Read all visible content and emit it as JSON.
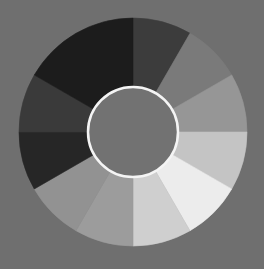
{
  "background": "#6f6f6f",
  "wheel": {
    "center": [
      133,
      132
    ],
    "outer_radius": 114,
    "inner_radius": 45,
    "inner_fill": "#727272",
    "inner_stroke": "#f4f4f4",
    "inner_stroke_width": 2.5,
    "segments": [
      {
        "name": "segment-0",
        "start": 0,
        "end": 30,
        "color": "#3c3c3c"
      },
      {
        "name": "segment-1",
        "start": 30,
        "end": 60,
        "color": "#7a7a7a"
      },
      {
        "name": "segment-2",
        "start": 60,
        "end": 90,
        "color": "#969696"
      },
      {
        "name": "segment-3",
        "start": 90,
        "end": 120,
        "color": "#c4c4c4"
      },
      {
        "name": "segment-4",
        "start": 120,
        "end": 150,
        "color": "#ececec"
      },
      {
        "name": "segment-5",
        "start": 150,
        "end": 180,
        "color": "#cfcfcf"
      },
      {
        "name": "segment-6",
        "start": 180,
        "end": 210,
        "color": "#9c9c9c"
      },
      {
        "name": "segment-7",
        "start": 210,
        "end": 240,
        "color": "#929292"
      },
      {
        "name": "segment-8",
        "start": 240,
        "end": 270,
        "color": "#262626"
      },
      {
        "name": "segment-9",
        "start": 270,
        "end": 300,
        "color": "#3a3a3a"
      },
      {
        "name": "segment-10",
        "start": 300,
        "end": 360,
        "color": "#1c1c1c"
      }
    ]
  }
}
